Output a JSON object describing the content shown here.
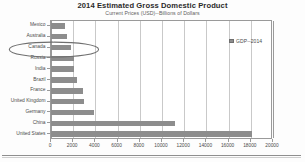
{
  "chart_data": {
    "type": "bar",
    "orientation": "horizontal",
    "title": "2014 Estimated Gross Domestic Product",
    "subtitle": "Current Prices (USD)--Billions of Dollars",
    "xlabel": "",
    "ylabel": "",
    "xlim": [
      0,
      20000
    ],
    "xticks": [
      0,
      2000,
      4000,
      6000,
      8000,
      10000,
      12000,
      14000,
      16000,
      18000,
      20000
    ],
    "xtick_labels": [
      "0",
      "2000",
      "4000",
      "6000",
      "8000",
      "10000",
      "12000",
      "14000",
      "16000",
      "18000",
      "20000"
    ],
    "grid": "vertical",
    "legend": {
      "position": "upper-right-inside",
      "entries": [
        {
          "label": "GDP--2014",
          "color": "#8d8d8d"
        }
      ]
    },
    "bar_color": "#8d8d8d",
    "categories": [
      "Mexico",
      "Australia",
      "Canada",
      "Russia",
      "India",
      "Brazil",
      "France",
      "United Kingdom",
      "Germany",
      "China",
      "United States"
    ],
    "values": [
      1300,
      1450,
      1790,
      2060,
      2050,
      2350,
      2850,
      2950,
      3850,
      11200,
      18100
    ],
    "series": [
      {
        "name": "GDP--2014",
        "values": [
          1300,
          1450,
          1790,
          2060,
          2050,
          2350,
          2850,
          2950,
          3850,
          11200,
          18100
        ]
      }
    ],
    "annotations": [
      {
        "type": "ellipse",
        "target_category": "Canada",
        "style": "hand-drawn-oval-highlight",
        "color": "#6f6f6f"
      }
    ]
  }
}
